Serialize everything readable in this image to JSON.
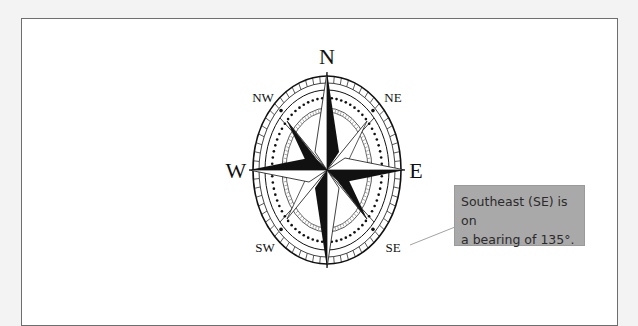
{
  "diagram": {
    "type": "compass-rose",
    "cardinal_labels": {
      "north": "N",
      "east": "E",
      "south": "S",
      "west": "W"
    },
    "intercardinal_labels": {
      "northeast": "NE",
      "southeast": "SE",
      "southwest": "SW",
      "northwest": "NW"
    },
    "callout": {
      "line1": "Southeast (SE) is on",
      "line2": "a bearing of 135°.",
      "target": "SE"
    },
    "colors": {
      "ink": "#111111",
      "callout_fill": "#a9a9a9",
      "callout_text": "#2b2b2b",
      "frame_border": "#6e6e6e",
      "page_bg": "#f3f3f3",
      "panel_bg": "#ffffff"
    }
  }
}
